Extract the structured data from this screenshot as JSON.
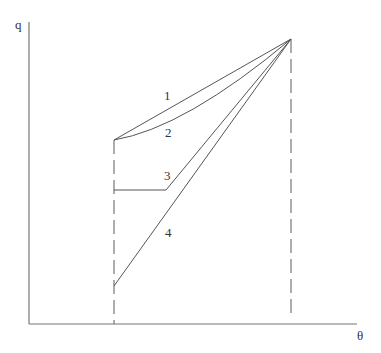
{
  "diagram": {
    "axes": {
      "y_label": "q",
      "x_label": "θ",
      "color": "#666666"
    },
    "reference_lines": [
      {
        "name": "theta-start",
        "style": "dashed"
      },
      {
        "name": "theta-end",
        "style": "dashed"
      }
    ],
    "curves": [
      {
        "id": "1",
        "label": "1",
        "shape": "straight line from start to peak"
      },
      {
        "id": "2",
        "label": "2",
        "shape": "concave curve from start to peak"
      },
      {
        "id": "3",
        "label": "3",
        "shape": "horizontal segment then line to peak"
      },
      {
        "id": "4",
        "label": "4",
        "shape": "straight line from low start to peak"
      }
    ],
    "line_color": "#555555"
  }
}
